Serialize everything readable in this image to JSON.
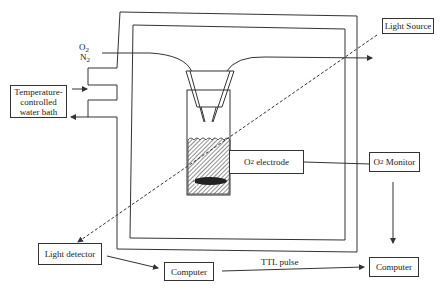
{
  "diagram": {
    "gas_inlet": {
      "o2": "O",
      "o2_sub": "2",
      "n2": "N",
      "n2_sub": "2"
    },
    "boxes": {
      "water_bath": {
        "line1": "Temperature-",
        "line2": "controlled",
        "line3": "water bath"
      },
      "light_source": "Light Source",
      "o2_electrode": {
        "prefix": "O",
        "sub": "2",
        "suffix": " electrode"
      },
      "o2_monitor": {
        "prefix": "O",
        "sub": "2",
        "suffix": " Monitor"
      },
      "light_detector": "Light detector",
      "computer_left": "Computer",
      "computer_right": "Computer"
    },
    "labels": {
      "ttl_pulse": "TTL pulse"
    },
    "colors": {
      "line": "#333333",
      "hatch": "#555555",
      "background": "#ffffff"
    }
  }
}
